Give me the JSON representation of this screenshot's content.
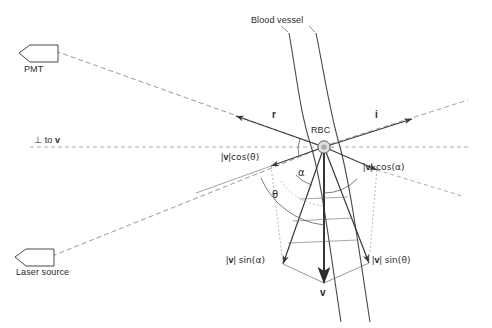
{
  "figure": {
    "title_elements": {
      "blood_vessel": "Blood vessel",
      "rbc": "RBC",
      "pmt": "PMT",
      "laser_source": "Laser source",
      "perpendicular": "⊥ to ",
      "perpendicular_vec": "v"
    },
    "vectors": {
      "r": "r",
      "i": "i",
      "v": "v"
    },
    "angles": {
      "theta": "θ",
      "alpha": "α"
    },
    "components": {
      "v_cos_theta_bar1": "|",
      "v_cos_theta_vec": "v",
      "v_cos_theta_bar2": "|",
      "v_cos_theta_expr": "cos(θ)",
      "v_cos_alpha_expr": "·cos(α)",
      "v_sin_alpha_expr": "sin(α)",
      "v_sin_theta_expr": "sin(θ)"
    },
    "labels_full": {
      "v_cos_theta": "|v| cos(θ)",
      "v_cos_alpha": "|v|·cos(α)",
      "v_sin_alpha": "|v| sin(α)",
      "v_sin_theta": "|v| sin(θ)"
    },
    "colors": {
      "line": "#3a3a3a",
      "dashed": "#8a8a8a",
      "vessel": "#4a4a4a",
      "text": "#2b2b2b",
      "background": "#ffffff",
      "rbc_fill": "#d9d9d9"
    },
    "geometry": {
      "rbc_center_x": 324,
      "rbc_center_y": 147,
      "rbc_radius": 6,
      "perpendicular_axis_y": 147
    }
  }
}
